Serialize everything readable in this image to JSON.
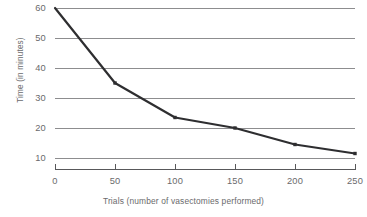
{
  "chart_data": {
    "type": "line",
    "title": "",
    "xlabel": "Trials (number of vasectomies performed)",
    "ylabel": "Time (in minutes)",
    "x": [
      0,
      50,
      100,
      150,
      200,
      250
    ],
    "values": [
      60,
      35,
      23.5,
      20,
      14.5,
      11.5
    ],
    "series": [
      {
        "name": "Time per vasectomy",
        "values": [
          60,
          35,
          23.5,
          20,
          14.5,
          11.5
        ]
      }
    ],
    "x_tick_labels": [
      "0",
      "50",
      "100",
      "150",
      "200",
      "250"
    ],
    "y_tick_labels": [
      "10",
      "20",
      "30",
      "40",
      "50",
      "60"
    ],
    "x_ticks": [
      0,
      50,
      100,
      150,
      200,
      250
    ],
    "y_ticks": [
      10,
      20,
      30,
      40,
      50,
      60
    ],
    "xlim": [
      0,
      250
    ],
    "ylim": [
      10,
      60
    ],
    "grid": "horizontal",
    "legend": "none",
    "marker": "square",
    "line_color": "#2e2e30",
    "grid_color": "#8d8d8f",
    "axis_color": "#58585a",
    "text_color": "#6a6a6c",
    "background_color": "#ffffff"
  }
}
